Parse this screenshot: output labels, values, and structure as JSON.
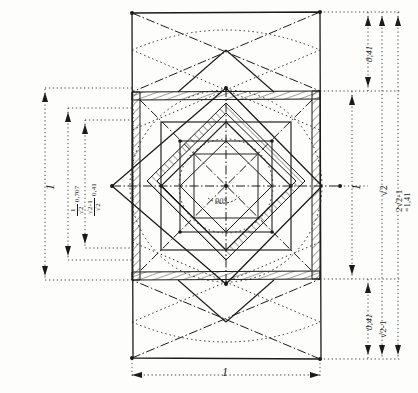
{
  "figure": {
    "kind": "hand-drawn technical geometry sketch",
    "angle_label": "90°",
    "bottom_dimension": "1",
    "left_dimensions": [
      {
        "name": "outer-left-span",
        "text": "1"
      },
      {
        "name": "inner-half-diagonal",
        "num": "1",
        "den": "√2",
        "value": "0,707"
      },
      {
        "name": "inner-offset",
        "num": "√2-1",
        "den": "√2",
        "value": "0,41"
      }
    ],
    "right_dimensions": [
      {
        "name": "top-gap",
        "text": "0,41"
      },
      {
        "name": "middle-span",
        "text": "1"
      },
      {
        "name": "bottom-gap",
        "text": "0,41"
      },
      {
        "name": "diagonal-span",
        "text": "√2"
      },
      {
        "name": "bottom-expr",
        "text": "√2-1"
      },
      {
        "name": "total-span-expr",
        "text": "2√2-1"
      },
      {
        "name": "total-span-value",
        "text": "=1,41"
      }
    ],
    "colors": {
      "ink": "#1a1a1a",
      "paper": "#fdfdfb",
      "dotted": "#2a2a2a"
    }
  }
}
